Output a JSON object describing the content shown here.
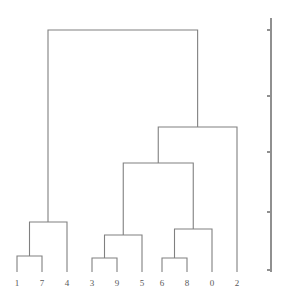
{
  "figure": {
    "type": "dendrogram",
    "background_color": "#ffffff",
    "link_color": "#808080",
    "axis_color": "#909090",
    "label_color": "#595959",
    "line_width": 1.1
  },
  "chart_data": {
    "type": "line",
    "subtype": "dendrogram",
    "title": "",
    "xlabel": "",
    "ylabel": "",
    "orientation": "top",
    "grid": false,
    "legend": false,
    "leaf_labels": [
      "1",
      "7",
      "4",
      "3",
      "9",
      "5",
      "6",
      "8",
      "0",
      "2"
    ],
    "leaf_count": 10,
    "leaf_positions_px": [
      17,
      42,
      67,
      92,
      117,
      142,
      162,
      187,
      212,
      237
    ],
    "baseline_y_px": 272,
    "ylim": [
      0,
      1.0
    ],
    "axis": {
      "visible": true,
      "side": "right",
      "spine_x_px": 271,
      "spine_top_y_px": 18,
      "spine_bottom_y_px": 272,
      "tick_labels": [],
      "tick_positions_px": [
        30,
        96,
        152,
        212,
        270
      ],
      "tick_length_px": 4
    },
    "links": [
      {
        "id": "L1",
        "children": [
          "1",
          "7"
        ],
        "x_left_px": 17,
        "x_right_px": 42,
        "y_left_px": 272,
        "y_right_px": 272,
        "height_y_px": 256,
        "height_value": 0.063
      },
      {
        "id": "L2",
        "children": [
          "L1",
          "4"
        ],
        "x_left_px": 29.5,
        "x_right_px": 67,
        "y_left_px": 256,
        "y_right_px": 272,
        "height_y_px": 222,
        "height_value": 0.197
      },
      {
        "id": "L3",
        "children": [
          "3",
          "9"
        ],
        "x_left_px": 92,
        "x_right_px": 117,
        "y_left_px": 272,
        "y_right_px": 272,
        "height_y_px": 258,
        "height_value": 0.055
      },
      {
        "id": "L4",
        "children": [
          "L3",
          "5"
        ],
        "x_left_px": 104.5,
        "x_right_px": 142,
        "y_left_px": 258,
        "y_right_px": 272,
        "height_y_px": 235,
        "height_value": 0.146
      },
      {
        "id": "L5",
        "children": [
          "6",
          "8"
        ],
        "x_left_px": 162,
        "x_right_px": 187,
        "y_left_px": 272,
        "y_right_px": 272,
        "height_y_px": 258,
        "height_value": 0.055
      },
      {
        "id": "L6",
        "children": [
          "L5",
          "0"
        ],
        "x_left_px": 174.5,
        "x_right_px": 212,
        "y_left_px": 258,
        "y_right_px": 272,
        "height_y_px": 229,
        "height_value": 0.169
      },
      {
        "id": "L7",
        "children": [
          "L4",
          "L6"
        ],
        "x_left_px": 123.25,
        "x_right_px": 193.25,
        "y_left_px": 235,
        "y_right_px": 229,
        "height_y_px": 163,
        "height_value": 0.429
      },
      {
        "id": "L8",
        "children": [
          "L7",
          "2"
        ],
        "x_left_px": 158.25,
        "x_right_px": 237,
        "y_left_px": 163,
        "y_right_px": 272,
        "height_y_px": 127,
        "height_value": 0.571
      },
      {
        "id": "L9",
        "children": [
          "L2",
          "L8"
        ],
        "x_left_px": 48,
        "x_right_px": 197.625,
        "y_left_px": 222,
        "y_right_px": 127,
        "height_y_px": 30,
        "height_value": 0.953
      }
    ]
  }
}
